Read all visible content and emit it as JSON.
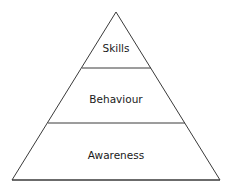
{
  "diagram": {
    "type": "pyramid",
    "levels": [
      {
        "label": "Skills"
      },
      {
        "label": "Behaviour"
      },
      {
        "label": "Awareness"
      }
    ],
    "colors": {
      "stroke": "#3a3a3a",
      "fill": "#ffffff",
      "text": "#1a1a1a"
    }
  }
}
